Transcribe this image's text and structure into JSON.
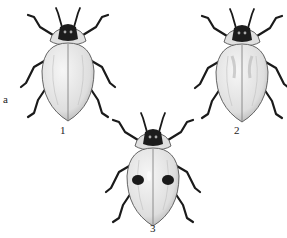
{
  "figure": {
    "side_label": "a",
    "specimens": [
      {
        "number": "1",
        "pattern": "plain pale elytra"
      },
      {
        "number": "2",
        "pattern": "pale elytra with faint markings"
      },
      {
        "number": "3",
        "pattern": "elytra with two dark spots"
      }
    ]
  },
  "colors": {
    "ink": "#1a1a1a",
    "elytra_light": "#ececec",
    "elytra_shade": "#b8b8b8",
    "background": "#ffffff"
  }
}
